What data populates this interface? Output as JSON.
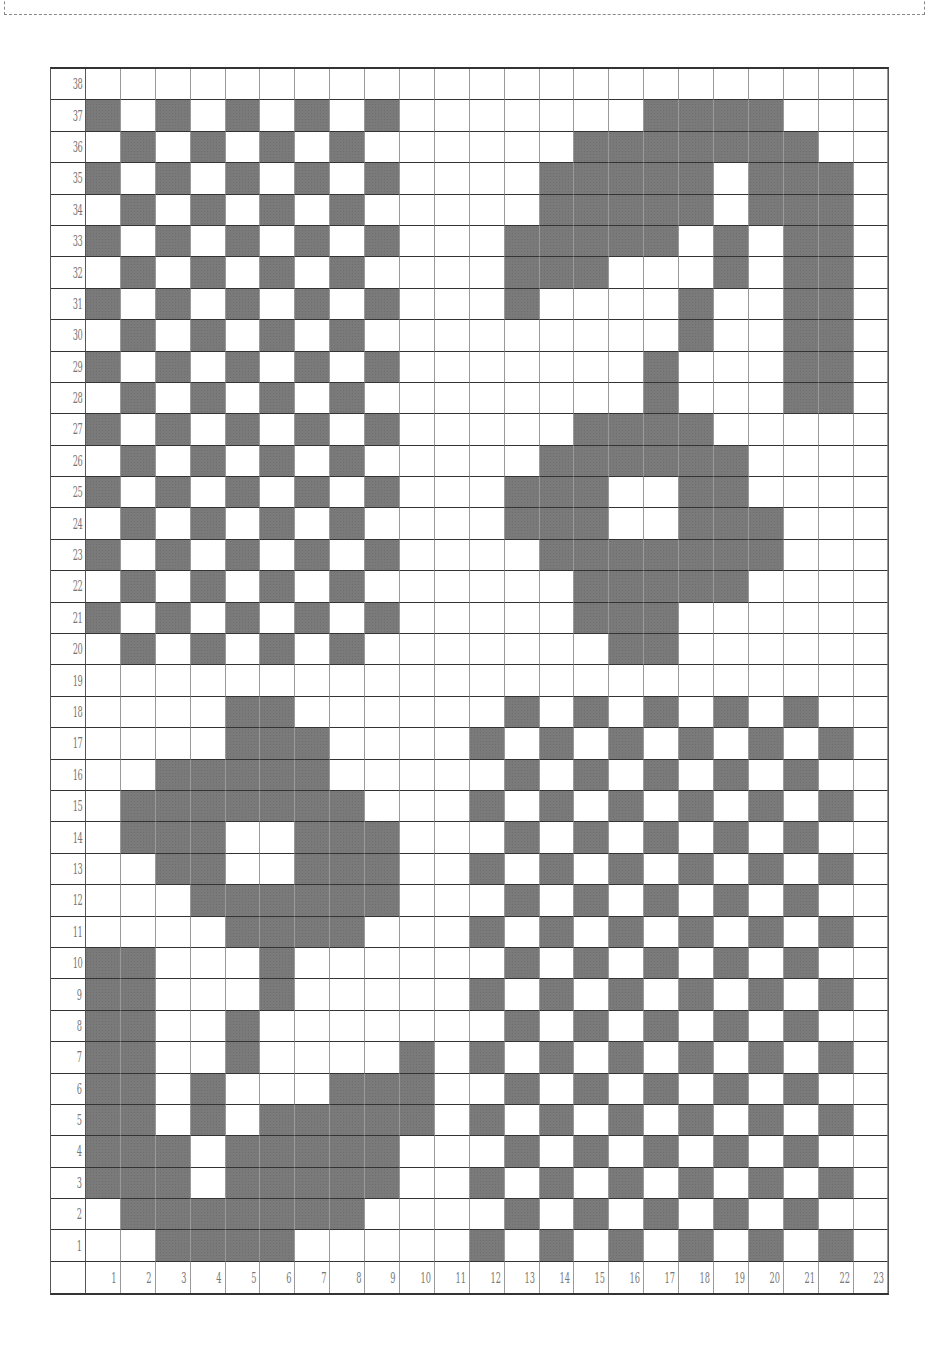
{
  "page": {
    "header_fragment": "",
    "figure_type": "knitting-pattern-chart"
  },
  "chart_data": {
    "type": "table",
    "title": "",
    "rows_count": 38,
    "cols_count": 23,
    "row_labels": [
      "38",
      "37",
      "36",
      "35",
      "34",
      "33",
      "32",
      "31",
      "30",
      "29",
      "28",
      "27",
      "26",
      "25",
      "24",
      "23",
      "22",
      "21",
      "20",
      "19",
      "18",
      "17",
      "16",
      "15",
      "14",
      "13",
      "12",
      "11",
      "10",
      "9",
      "8",
      "7",
      "6",
      "5",
      "4",
      "3",
      "2",
      "1"
    ],
    "col_labels": [
      "1",
      "2",
      "3",
      "4",
      "5",
      "6",
      "7",
      "8",
      "9",
      "10",
      "11",
      "12",
      "13",
      "14",
      "15",
      "16",
      "17",
      "18",
      "19",
      "20",
      "21",
      "22",
      "23"
    ],
    "fill_color": "#7a7a7a",
    "empty_color": "#ffffff",
    "filled_cells_by_row": {
      "38": [],
      "37": [
        1,
        3,
        5,
        7,
        9,
        17,
        18,
        19,
        20
      ],
      "36": [
        2,
        4,
        6,
        8,
        15,
        16,
        17,
        18,
        19,
        20,
        21
      ],
      "35": [
        1,
        3,
        5,
        7,
        9,
        14,
        15,
        16,
        17,
        18,
        20,
        21,
        22
      ],
      "34": [
        2,
        4,
        6,
        8,
        14,
        15,
        16,
        17,
        18,
        20,
        21,
        22
      ],
      "33": [
        1,
        3,
        5,
        7,
        9,
        13,
        14,
        15,
        16,
        17,
        19,
        21,
        22
      ],
      "32": [
        2,
        4,
        6,
        8,
        13,
        14,
        15,
        19,
        21,
        22
      ],
      "31": [
        1,
        3,
        5,
        7,
        9,
        13,
        18,
        21,
        22
      ],
      "30": [
        2,
        4,
        6,
        8,
        18,
        21,
        22
      ],
      "29": [
        1,
        3,
        5,
        7,
        9,
        17,
        21,
        22
      ],
      "28": [
        2,
        4,
        6,
        8,
        17,
        21,
        22
      ],
      "27": [
        1,
        3,
        5,
        7,
        9,
        15,
        16,
        17,
        18
      ],
      "26": [
        2,
        4,
        6,
        8,
        14,
        15,
        16,
        17,
        18,
        19
      ],
      "25": [
        1,
        3,
        5,
        7,
        9,
        13,
        14,
        15,
        18,
        19
      ],
      "24": [
        2,
        4,
        6,
        8,
        13,
        14,
        15,
        18,
        19,
        20
      ],
      "23": [
        1,
        3,
        5,
        7,
        9,
        14,
        15,
        16,
        17,
        18,
        19,
        20
      ],
      "22": [
        2,
        4,
        6,
        8,
        15,
        16,
        17,
        18,
        19
      ],
      "21": [
        1,
        3,
        5,
        7,
        9,
        15,
        16,
        17
      ],
      "20": [
        2,
        4,
        6,
        8,
        16,
        17
      ],
      "19": [],
      "18": [
        5,
        6,
        13,
        15,
        17,
        19,
        21
      ],
      "17": [
        5,
        6,
        7,
        12,
        14,
        16,
        18,
        20,
        22
      ],
      "16": [
        3,
        4,
        5,
        6,
        7,
        13,
        15,
        17,
        19,
        21
      ],
      "15": [
        2,
        3,
        4,
        5,
        6,
        7,
        8,
        12,
        14,
        16,
        18,
        20,
        22
      ],
      "14": [
        2,
        3,
        4,
        7,
        8,
        9,
        13,
        15,
        17,
        19,
        21
      ],
      "13": [
        3,
        4,
        7,
        8,
        9,
        12,
        14,
        16,
        18,
        20,
        22
      ],
      "12": [
        4,
        5,
        6,
        7,
        8,
        9,
        13,
        15,
        17,
        19,
        21
      ],
      "11": [
        5,
        6,
        7,
        8,
        12,
        14,
        16,
        18,
        20,
        22
      ],
      "10": [
        1,
        2,
        6,
        13,
        15,
        17,
        19,
        21
      ],
      "9": [
        1,
        2,
        6,
        12,
        14,
        16,
        18,
        20,
        22
      ],
      "8": [
        1,
        2,
        5,
        13,
        15,
        17,
        19,
        21
      ],
      "7": [
        1,
        2,
        5,
        10,
        12,
        14,
        16,
        18,
        20,
        22
      ],
      "6": [
        1,
        2,
        4,
        8,
        9,
        10,
        13,
        15,
        17,
        19,
        21
      ],
      "5": [
        1,
        2,
        4,
        6,
        7,
        8,
        9,
        10,
        12,
        14,
        16,
        18,
        20,
        22
      ],
      "4": [
        1,
        2,
        3,
        5,
        6,
        7,
        8,
        9,
        13,
        15,
        17,
        19,
        21
      ],
      "3": [
        1,
        2,
        3,
        5,
        6,
        7,
        8,
        9,
        12,
        14,
        16,
        18,
        20,
        22
      ],
      "2": [
        2,
        3,
        4,
        5,
        6,
        7,
        8,
        13,
        15,
        17,
        19,
        21
      ],
      "1": [
        3,
        4,
        5,
        6,
        12,
        14,
        16,
        18,
        20,
        22
      ]
    },
    "motifs": [
      {
        "name": "checkerboard-top-left",
        "rows": [
          20,
          37
        ],
        "cols": [
          1,
          9
        ]
      },
      {
        "name": "swan-or-figure-top-right",
        "rows": [
          20,
          37
        ],
        "cols": [
          13,
          22
        ]
      },
      {
        "name": "flower-and-stem-bottom-left",
        "rows": [
          1,
          18
        ],
        "cols": [
          1,
          10
        ]
      },
      {
        "name": "checkerboard-bottom-right",
        "rows": [
          1,
          18
        ],
        "cols": [
          12,
          22
        ]
      }
    ],
    "grid": true,
    "legend": null
  }
}
